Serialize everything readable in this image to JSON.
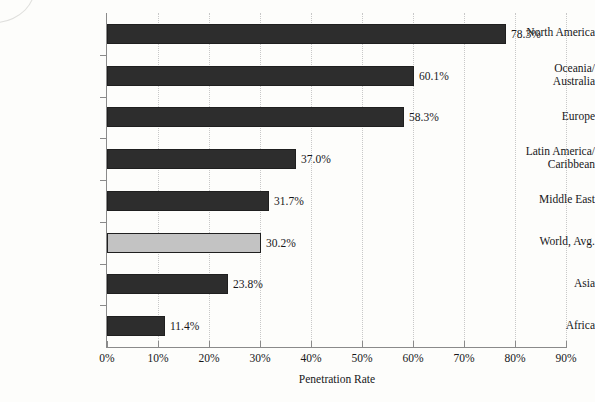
{
  "chart_data": {
    "type": "bar",
    "orientation": "horizontal",
    "title": "",
    "xlabel": "Penetration Rate",
    "ylabel": "",
    "xlim": [
      0,
      90
    ],
    "xticks": [
      "0%",
      "10%",
      "20%",
      "30%",
      "40%",
      "50%",
      "60%",
      "70%",
      "80%",
      "90%"
    ],
    "xtick_values": [
      0,
      10,
      20,
      30,
      40,
      50,
      60,
      70,
      80,
      90
    ],
    "grid": "vertical-dotted",
    "legend": "none",
    "categories": [
      "North America",
      "Oceania/ Australia",
      "Europe",
      "Latin America/ Caribbean",
      "Middle East",
      "World, Avg.",
      "Asia",
      "Africa"
    ],
    "values": [
      78.3,
      60.1,
      58.3,
      37.0,
      31.7,
      30.2,
      23.8,
      11.4
    ],
    "data_labels": [
      "78.3%",
      "60.1%",
      "58.3%",
      "37.0%",
      "31.7%",
      "30.2%",
      "23.8%",
      "11.4%"
    ],
    "bars": [
      {
        "label_lines": [
          "North America"
        ],
        "value": 78.3,
        "data_label": "78.3%",
        "highlight": false
      },
      {
        "label_lines": [
          "Oceania/",
          "Australia"
        ],
        "value": 60.1,
        "data_label": "60.1%",
        "highlight": false
      },
      {
        "label_lines": [
          "Europe"
        ],
        "value": 58.3,
        "data_label": "58.3%",
        "highlight": false
      },
      {
        "label_lines": [
          "Latin America/",
          "Caribbean"
        ],
        "value": 37.0,
        "data_label": "37.0%",
        "highlight": false
      },
      {
        "label_lines": [
          "Middle East"
        ],
        "value": 31.7,
        "data_label": "31.7%",
        "highlight": false
      },
      {
        "label_lines": [
          "World, Avg."
        ],
        "value": 30.2,
        "data_label": "30.2%",
        "highlight": true
      },
      {
        "label_lines": [
          "Asia"
        ],
        "value": 23.8,
        "data_label": "23.8%",
        "highlight": false
      },
      {
        "label_lines": [
          "Africa"
        ],
        "value": 11.4,
        "data_label": "11.4%",
        "highlight": false
      }
    ],
    "colors": {
      "bar": "#2d2d2d",
      "bar_highlight": "#c3c3c3",
      "bar_border": "#1f1f1f",
      "axis": "#8a8a8a",
      "grid": "#c8c8c8",
      "text": "#17171a",
      "background": "#fdfdfb"
    }
  }
}
